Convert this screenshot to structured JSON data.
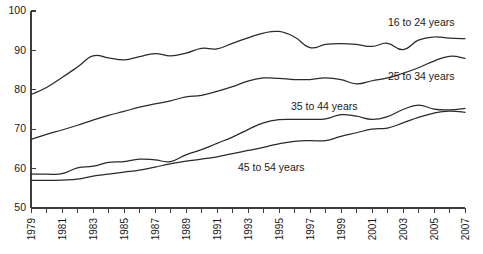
{
  "chart_data": {
    "type": "line",
    "title": "",
    "subtitle": "",
    "xlabel": "",
    "ylabel": "",
    "xlim": [
      1979,
      2007
    ],
    "ylim": [
      50,
      100
    ],
    "grid": false,
    "legend_position": "inline-annotations",
    "y_ticks": [
      50,
      60,
      70,
      80,
      90,
      100
    ],
    "x_ticks_labeled": [
      1979,
      1981,
      1983,
      1985,
      1987,
      1989,
      1991,
      1993,
      1995,
      1997,
      1999,
      2001,
      2003,
      2005,
      2007
    ],
    "x_ticks_minor_every": 1,
    "x": [
      1979,
      1980,
      1981,
      1982,
      1983,
      1984,
      1985,
      1986,
      1987,
      1988,
      1989,
      1990,
      1991,
      1992,
      1993,
      1994,
      1995,
      1996,
      1997,
      1998,
      1999,
      2000,
      2001,
      2002,
      2003,
      2004,
      2005,
      2006,
      2007
    ],
    "series": [
      {
        "name": "16 to 24 years",
        "label": "16 to 24 years",
        "color": "#2b2b2b",
        "values": [
          78.8,
          80.6,
          83.1,
          85.8,
          88.6,
          88.1,
          87.6,
          88.4,
          89.2,
          88.6,
          89.3,
          90.5,
          90.4,
          91.8,
          93.2,
          94.4,
          94.8,
          93.4,
          90.7,
          91.5,
          91.7,
          91.5,
          91.0,
          91.8,
          90.2,
          92.6,
          93.4,
          93.1,
          93.0
        ]
      },
      {
        "name": "25 to 34 years",
        "label": "25 to 34 years",
        "color": "#2b2b2b",
        "values": [
          67.4,
          68.7,
          69.8,
          71.0,
          72.3,
          73.5,
          74.5,
          75.6,
          76.4,
          77.2,
          78.2,
          78.6,
          79.6,
          80.8,
          82.2,
          83.0,
          82.9,
          82.6,
          82.6,
          83.0,
          82.6,
          81.5,
          82.3,
          83.0,
          84.2,
          85.6,
          87.3,
          88.5,
          88.0
        ]
      },
      {
        "name": "35 to 44 years",
        "label": "35 to 44 years",
        "color": "#2b2b2b",
        "values": [
          58.6,
          58.6,
          58.7,
          60.2,
          60.6,
          61.6,
          61.8,
          62.4,
          62.2,
          61.8,
          63.5,
          64.8,
          66.4,
          68.0,
          69.9,
          71.6,
          72.4,
          72.5,
          72.5,
          72.6,
          73.7,
          73.3,
          72.5,
          73.2,
          75.0,
          76.1,
          75.1,
          74.9,
          75.3
        ]
      },
      {
        "name": "45 to 54 years",
        "label": "45 to 54 years",
        "color": "#2b2b2b",
        "values": [
          57.0,
          57.0,
          57.1,
          57.3,
          58.1,
          58.6,
          59.1,
          59.6,
          60.4,
          61.2,
          61.9,
          62.4,
          63.0,
          63.8,
          64.6,
          65.4,
          66.3,
          66.9,
          67.1,
          67.1,
          68.2,
          69.1,
          70.0,
          70.3,
          71.6,
          73.0,
          74.1,
          74.6,
          74.3
        ]
      }
    ],
    "annotations": [
      {
        "text": "16 to 24 years",
        "x_px": 388,
        "y_px": 26
      },
      {
        "text": "25 to 34 years",
        "x_px": 388,
        "y_px": 80
      },
      {
        "text": "35 to 44 years",
        "x_px": 291,
        "y_px": 110
      },
      {
        "text": "45 to 54 years",
        "x_px": 238,
        "y_px": 171
      }
    ]
  }
}
